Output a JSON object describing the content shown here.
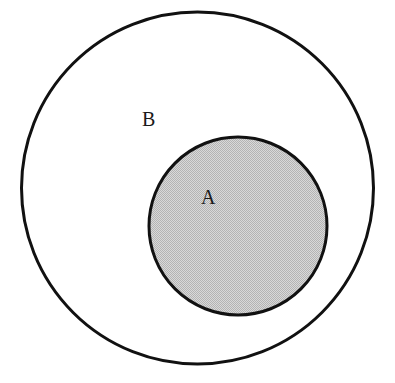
{
  "figure": {
    "kind": "euler-diagram",
    "background_color": "#ffffff",
    "stroke_color": "#111111"
  },
  "labels": {
    "outer_set": "B",
    "inner_set": "A"
  },
  "chart_data": {
    "type": "diagram",
    "title": "",
    "subtitle": "",
    "xlabel": "",
    "ylabel": "",
    "relation": "A is a proper subset of B",
    "sets": [
      {
        "name": "B",
        "role": "outer",
        "label": "B",
        "cx": 197.5,
        "cy": 188,
        "r": 176,
        "fill": "#ffffff",
        "fill_style": "none",
        "stroke": "#111111",
        "stroke_width": 3,
        "label_x": 149,
        "label_y": 118
      },
      {
        "name": "A",
        "role": "inner",
        "label": "A",
        "cx": 238,
        "cy": 226,
        "r": 89,
        "fill": "#c9c9c9",
        "fill_style": "stippled-halftone",
        "stroke": "#111111",
        "stroke_width": 3,
        "label_x": 208,
        "label_y": 196
      }
    ],
    "legend": [],
    "annotations": [],
    "grid": false,
    "legend_position": "none"
  }
}
